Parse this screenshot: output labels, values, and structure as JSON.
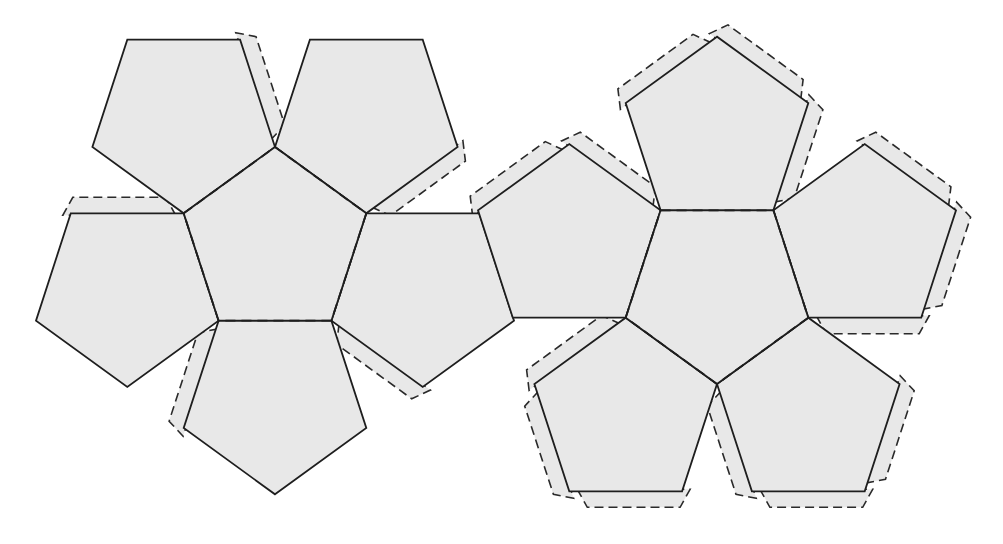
{
  "diagram": {
    "colors": {
      "face_fill": "#e8e8e8",
      "tab_fill": "#e8e8e8",
      "line": "#1e1e1e",
      "background": "#ffffff"
    },
    "clusters": [
      {
        "name": "left-cluster",
        "center": [
          275,
          243
        ],
        "radius": 96,
        "orientation": "up",
        "petals": [
          0,
          1,
          2,
          3,
          4
        ]
      },
      {
        "name": "right-cluster",
        "center": [
          717,
          288
        ],
        "radius": 96,
        "orientation": "down",
        "petals": [
          0,
          1,
          2,
          3,
          4
        ]
      }
    ],
    "faces_count": 12,
    "line_legend": {
      "solid": "cut line",
      "dashed": "fold line / glue tab"
    }
  }
}
